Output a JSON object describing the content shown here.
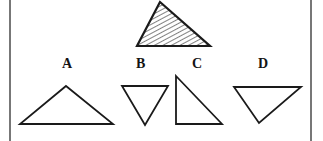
{
  "figure": {
    "background_color": "#ffffff",
    "stroke_color": "#1a1a1a",
    "hatch_color": "#2b2b2b",
    "border": {
      "name": "page-rule-lines",
      "color": "#555555",
      "left_x": 10,
      "right_x": 311,
      "top_y": 0,
      "bottom_y": 141,
      "width": 1.6
    },
    "target_shape": {
      "name": "hatched-triangle",
      "label": "",
      "fill": "hatch",
      "hatch_angle_deg": 62,
      "hatch_spacing": 4,
      "points": "160,2 210,46 137,46",
      "stroke_width": 2.2
    },
    "options": [
      {
        "key": "A",
        "label": "A",
        "label_x": 62,
        "label_y": 57,
        "points": "66,86 113,124 20,124",
        "stroke_width": 1.8,
        "description": "obtuse triangle, apex up, wide horizontal base"
      },
      {
        "key": "B",
        "label": "B",
        "label_x": 136,
        "label_y": 57,
        "points": "122,86 168,86 145,125",
        "stroke_width": 1.8,
        "description": "inverted triangle pointing down"
      },
      {
        "key": "C",
        "label": "C",
        "label_x": 192,
        "label_y": 57,
        "points": "176,76 222,124 176,124",
        "stroke_width": 1.8,
        "description": "right triangle, vertical left leg, horizontal bottom leg"
      },
      {
        "key": "D",
        "label": "D",
        "label_x": 258,
        "label_y": 57,
        "points": "234,87 301,87 259,123",
        "stroke_width": 1.8,
        "description": "triangle with horizontal top edge and apex pointing down-left"
      }
    ]
  }
}
